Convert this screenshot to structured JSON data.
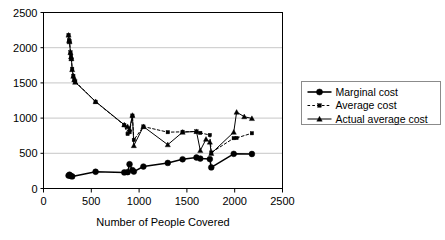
{
  "chart_data": {
    "type": "line",
    "title": "",
    "xlabel": "Number of People Covered",
    "ylabel": "",
    "xlim": [
      0,
      2500
    ],
    "ylim": [
      0,
      2500
    ],
    "xticks": [
      0,
      500,
      1000,
      1500,
      2000,
      2500
    ],
    "yticks": [
      0,
      500,
      1000,
      1500,
      2000,
      2500
    ],
    "xtick_labels": [
      "0",
      "500",
      "1000",
      "1500",
      "2000",
      "2500"
    ],
    "ytick_labels": [
      "0",
      "500",
      "1000",
      "1500",
      "2000",
      "2500"
    ],
    "grid": "horizontal",
    "legend_position": "right",
    "series": [
      {
        "name": "Marginal cost",
        "style": "solid",
        "marker": "circle",
        "color": "#000000",
        "points": [
          [
            262,
            183
          ],
          [
            272,
            196
          ],
          [
            285,
            178
          ],
          [
            300,
            172
          ],
          [
            545,
            238
          ],
          [
            845,
            228
          ],
          [
            880,
            232
          ],
          [
            900,
            345
          ],
          [
            930,
            262
          ],
          [
            945,
            240
          ],
          [
            1045,
            312
          ],
          [
            1300,
            363
          ],
          [
            1455,
            415
          ],
          [
            1600,
            440
          ],
          [
            1640,
            425
          ],
          [
            1740,
            418
          ],
          [
            1755,
            300
          ],
          [
            1990,
            492
          ],
          [
            2180,
            490
          ]
        ]
      },
      {
        "name": "Average cost",
        "style": "dashed",
        "marker": "small-square",
        "color": "#000000",
        "points": [
          [
            262,
            2180
          ],
          [
            268,
            2105
          ],
          [
            272,
            2090
          ],
          [
            282,
            1935
          ],
          [
            288,
            1880
          ],
          [
            292,
            1840
          ],
          [
            300,
            1700
          ],
          [
            312,
            1600
          ],
          [
            322,
            1540
          ],
          [
            332,
            1520
          ],
          [
            545,
            1232
          ],
          [
            845,
            900
          ],
          [
            880,
            775
          ],
          [
            900,
            800
          ],
          [
            930,
            1035
          ],
          [
            945,
            690
          ],
          [
            1045,
            880
          ],
          [
            1300,
            800
          ],
          [
            1455,
            805
          ],
          [
            1600,
            810
          ],
          [
            1640,
            790
          ],
          [
            1740,
            760
          ],
          [
            1755,
            510
          ],
          [
            1990,
            715
          ],
          [
            2020,
            718
          ],
          [
            2180,
            785
          ]
        ]
      },
      {
        "name": "Actual average cost",
        "style": "solid",
        "marker": "triangle",
        "color": "#000000",
        "points": [
          [
            262,
            2180
          ],
          [
            268,
            2105
          ],
          [
            272,
            2085
          ],
          [
            282,
            1930
          ],
          [
            288,
            1870
          ],
          [
            292,
            1845
          ],
          [
            300,
            1690
          ],
          [
            312,
            1595
          ],
          [
            322,
            1545
          ],
          [
            332,
            1510
          ],
          [
            545,
            1235
          ],
          [
            845,
            905
          ],
          [
            880,
            880
          ],
          [
            900,
            845
          ],
          [
            930,
            1040
          ],
          [
            945,
            610
          ],
          [
            1045,
            880
          ],
          [
            1300,
            622
          ],
          [
            1455,
            800
          ],
          [
            1600,
            810
          ],
          [
            1640,
            540
          ],
          [
            1700,
            700
          ],
          [
            1740,
            660
          ],
          [
            1755,
            498
          ],
          [
            1990,
            800
          ],
          [
            2020,
            1085
          ],
          [
            2100,
            1020
          ],
          [
            2180,
            995
          ]
        ]
      }
    ]
  },
  "legend": {
    "items": [
      {
        "label": "Marginal cost",
        "marker": "circle",
        "style": "solid"
      },
      {
        "label": "Average cost",
        "marker": "small-square",
        "style": "dashed"
      },
      {
        "label": "Actual average cost",
        "marker": "triangle",
        "style": "solid"
      }
    ]
  }
}
